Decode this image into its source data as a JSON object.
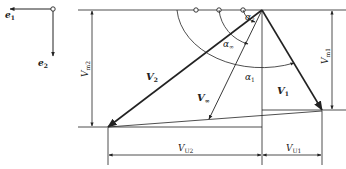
{
  "diagram": {
    "axes": {
      "e1": "e",
      "e1_sub": "1",
      "e2": "e",
      "e2_sub": "2"
    },
    "vectors": {
      "V1": {
        "main": "V",
        "sub": "1"
      },
      "V2": {
        "main": "V",
        "sub": "2"
      },
      "Vm": {
        "main": "V",
        "sub": "∞"
      }
    },
    "angles": {
      "alpha1": {
        "main": "α",
        "sub": "1"
      },
      "alpha2": {
        "main": "α",
        "sub": "2"
      },
      "alpham": {
        "main": "α",
        "sub": "∞"
      }
    },
    "dimensions": {
      "Vm1": {
        "main": "V",
        "sub": "m1"
      },
      "Vm2": {
        "main": "V",
        "sub": "m2"
      },
      "VU1": {
        "main": "V",
        "sub": "U1"
      },
      "VU2": {
        "main": "V",
        "sub": "U2"
      }
    },
    "colors": {
      "line": "#222222",
      "background": "#ffffff"
    }
  }
}
